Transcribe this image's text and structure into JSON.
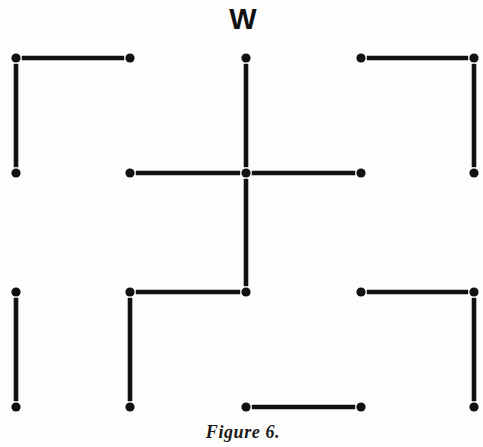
{
  "figure": {
    "caption": "Figure 6.",
    "caption_position": {
      "x": 243,
      "y": 432
    },
    "background_color": "#fdfdfc",
    "ink_color": "#111111",
    "width": 483,
    "height": 447
  },
  "labels": [
    {
      "text": "W",
      "x": 243,
      "y": 19,
      "name": "label-w"
    }
  ],
  "grid": {
    "columns_x": [
      16,
      130,
      246,
      361,
      474
    ],
    "rows_y": [
      58,
      173,
      292,
      407
    ],
    "dot_radius": 4.6,
    "stick_thickness": 4.6
  },
  "dots": [
    {
      "col": 0,
      "row": 0
    },
    {
      "col": 1,
      "row": 0
    },
    {
      "col": 2,
      "row": 0
    },
    {
      "col": 3,
      "row": 0
    },
    {
      "col": 4,
      "row": 0
    },
    {
      "col": 0,
      "row": 1
    },
    {
      "col": 1,
      "row": 1
    },
    {
      "col": 2,
      "row": 1
    },
    {
      "col": 3,
      "row": 1
    },
    {
      "col": 4,
      "row": 1
    },
    {
      "col": 0,
      "row": 2
    },
    {
      "col": 1,
      "row": 2
    },
    {
      "col": 2,
      "row": 2
    },
    {
      "col": 3,
      "row": 2
    },
    {
      "col": 4,
      "row": 2
    },
    {
      "col": 0,
      "row": 3
    },
    {
      "col": 1,
      "row": 3
    },
    {
      "col": 2,
      "row": 3
    },
    {
      "col": 3,
      "row": 3
    },
    {
      "col": 4,
      "row": 3
    }
  ],
  "horizontal_sticks": [
    {
      "row": 0,
      "from_col": 0,
      "to_col": 1
    },
    {
      "row": 0,
      "from_col": 3,
      "to_col": 4
    },
    {
      "row": 1,
      "from_col": 1,
      "to_col": 2
    },
    {
      "row": 1,
      "from_col": 2,
      "to_col": 3
    },
    {
      "row": 2,
      "from_col": 1,
      "to_col": 2
    },
    {
      "row": 2,
      "from_col": 3,
      "to_col": 4
    },
    {
      "row": 3,
      "from_col": 2,
      "to_col": 3
    }
  ],
  "vertical_sticks": [
    {
      "col": 0,
      "from_row": 0,
      "to_row": 1
    },
    {
      "col": 2,
      "from_row": 0,
      "to_row": 1
    },
    {
      "col": 4,
      "from_row": 0,
      "to_row": 1
    },
    {
      "col": 2,
      "from_row": 1,
      "to_row": 2
    },
    {
      "col": 0,
      "from_row": 2,
      "to_row": 3
    },
    {
      "col": 1,
      "from_row": 2,
      "to_row": 3
    },
    {
      "col": 4,
      "from_row": 2,
      "to_row": 3
    }
  ]
}
